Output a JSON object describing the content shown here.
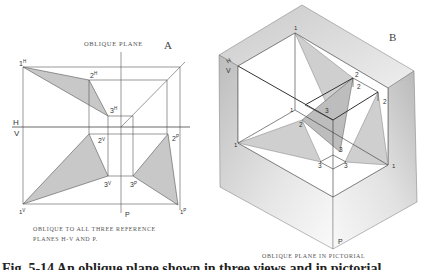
{
  "view_a": {
    "letter": "A",
    "title": "OBLIQUE PLANE",
    "caption_line1": "OBLIQUE TO ALL THREE REFERENCE",
    "caption_line2": "PLANES H-V AND P.",
    "fold_labels": {
      "h": "H",
      "v": "V",
      "p": "P"
    },
    "points": {
      "1h": "1",
      "1h_sup": "H",
      "2h": "2",
      "2h_sup": "H",
      "3h": "3",
      "3h_sup": "H",
      "1v": "1",
      "1v_sup": "V",
      "2v": "2",
      "2v_sup": "V",
      "3v": "3",
      "3v_sup": "V",
      "1p": "1",
      "1p_sup": "P",
      "2p": "2",
      "2p_sup": "P",
      "3p": "3",
      "3p_sup": "P"
    }
  },
  "view_b": {
    "letter": "B",
    "caption": "OBLIQUE PLANE IN PICTORIAL",
    "plane_labels": {
      "h": "H",
      "v": "V",
      "p": "P"
    },
    "points": {
      "top_1": "1",
      "left_1": "1",
      "right_1": "1",
      "inner_1": "1",
      "top_2": "2",
      "mid_2": "2",
      "right_2": "2",
      "inner_2": "2",
      "inner_3": "3",
      "lower_3": "3",
      "left_3": "3",
      "right_3": "3"
    }
  },
  "figure_caption_clipped": "Fig. 5-14  An oblique plane shown in three views and in pictorial."
}
